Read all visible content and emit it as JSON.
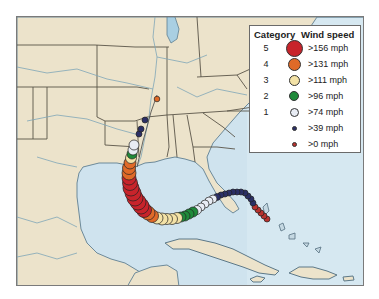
{
  "legend": {
    "title_category": "Category",
    "title_wind": "Wind speed",
    "rows": [
      {
        "category": "5",
        "label": ">156 mph",
        "color": "#c8242b",
        "size": 18
      },
      {
        "category": "4",
        "label": ">131 mph",
        "color": "#e06a28",
        "size": 13
      },
      {
        "category": "3",
        "label": ">111 mph",
        "color": "#f3e2a6",
        "size": 11
      },
      {
        "category": "2",
        "label": ">96 mph",
        "color": "#1f8a3a",
        "size": 10
      },
      {
        "category": "1",
        "label": ">74 mph",
        "color": "#e8ecf4",
        "size": 9
      },
      {
        "category": "",
        "label": ">39 mph",
        "color": "#2b2f66",
        "size": 5
      },
      {
        "category": "",
        "label": ">0 mph",
        "color": "#b8322e",
        "size": 5
      }
    ]
  },
  "colors": {
    "water": "#cfe3ee",
    "land": "#ece3cb",
    "border": "#5a5548",
    "river": "#7fa6b8"
  }
}
